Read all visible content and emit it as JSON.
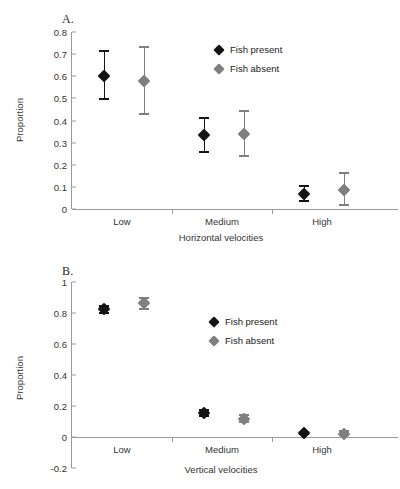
{
  "figure": {
    "background": "#ffffff",
    "series_colors": {
      "fish_present": "#141414",
      "fish_absent": "#7f7f7f"
    },
    "axis_color": "#9a9a9a"
  },
  "panels": [
    {
      "id": "A",
      "label": "A.",
      "ylabel": "Proportion",
      "xlabel": "Horizontal velocities",
      "legend": [
        "Fish present",
        "Fish absent"
      ]
    },
    {
      "id": "B",
      "label": "B.",
      "ylabel": "Proportion",
      "xlabel": "Vertical velocities",
      "legend": [
        "Fish present",
        "Fish absent"
      ]
    }
  ],
  "chart_data": [
    {
      "type": "scatter",
      "title": "A.",
      "xlabel": "Horizontal velocities",
      "ylabel": "Proportion",
      "categories": [
        "Low",
        "Medium",
        "High"
      ],
      "ylim": [
        0,
        0.8
      ],
      "yticks": [
        "0",
        "0.1",
        "0.2",
        "0.3",
        "0.4",
        "0.5",
        "0.6",
        "0.7",
        "0.8"
      ],
      "ytick_values": [
        0,
        0.1,
        0.2,
        0.3,
        0.4,
        0.5,
        0.6,
        0.7,
        0.8
      ],
      "grid": false,
      "legend_position": "upper-right-inside",
      "series": [
        {
          "name": "Fish present",
          "color": "#141414",
          "values": [
            0.6,
            0.333,
            0.068
          ],
          "err_low": [
            0.493,
            0.255,
            0.033
          ],
          "err_high": [
            0.718,
            0.415,
            0.108
          ]
        },
        {
          "name": "Fish absent",
          "color": "#7f7f7f",
          "values": [
            0.578,
            0.337,
            0.088
          ],
          "err_low": [
            0.427,
            0.233,
            0.012
          ],
          "err_high": [
            0.735,
            0.448,
            0.165
          ]
        }
      ]
    },
    {
      "type": "scatter",
      "title": "B.",
      "xlabel": "Vertical velocities",
      "ylabel": "Proportion",
      "categories": [
        "Low",
        "Medium",
        "High"
      ],
      "ylim": [
        -0.2,
        1
      ],
      "yticks": [
        "-0.2",
        "0",
        "0.2",
        "0.4",
        "0.6",
        "0.8",
        "1"
      ],
      "ytick_values": [
        -0.2,
        0,
        0.2,
        0.4,
        0.6,
        0.8,
        1
      ],
      "grid": false,
      "legend_position": "upper-right-inside",
      "series": [
        {
          "name": "Fish present",
          "color": "#141414",
          "values": [
            0.823,
            0.155,
            0.025
          ],
          "err_low": [
            0.795,
            0.13,
            0.013
          ],
          "err_high": [
            0.85,
            0.182,
            0.038
          ]
        },
        {
          "name": "Fish absent",
          "color": "#7f7f7f",
          "values": [
            0.867,
            0.115,
            0.022
          ],
          "err_low": [
            0.822,
            0.088,
            0.005
          ],
          "err_high": [
            0.905,
            0.148,
            0.042
          ]
        }
      ]
    }
  ]
}
